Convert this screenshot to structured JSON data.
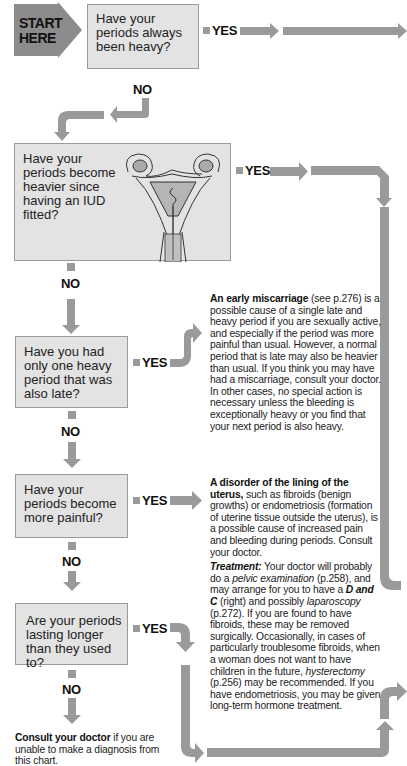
{
  "start": {
    "line1": "START",
    "line2": "HERE"
  },
  "questions": [
    {
      "id": "q1",
      "text": "Have your periods always been heavy?",
      "yes": "YES",
      "no": "NO"
    },
    {
      "id": "q2",
      "text": "Have your periods become heavier since having an IUD fitted?",
      "yes": "YES",
      "no": "NO"
    },
    {
      "id": "q3",
      "text": "Have you had only one heavy period that was also late?",
      "yes": "YES",
      "no": "NO"
    },
    {
      "id": "q4",
      "text": "Have your periods become more painful?",
      "yes": "YES",
      "no": "NO"
    },
    {
      "id": "q5",
      "text": "Are your periods lasting longer than they used to?",
      "yes": "YES",
      "no": "NO"
    }
  ],
  "q2_illustration": "uterus-with-iud-illustration",
  "info_miscarriage": {
    "title": "An early miscarriage",
    "ref": " (see p.276)",
    "body": " is a possible cause of a single late and heavy period if you are sexually active, and especially if the period was more painful than usual. However, a normal period that is late may also be heavier than usual. If you think you may have had a miscarriage, consult your doctor. In other cases, no special action is necessary unless the bleeding is exceptionally heavy or you find that your next period is also heavy."
  },
  "info_disorder": {
    "title": "A disorder of the lining of the uterus,",
    "body": " such as fibroids (benign growths) or endometriosis (formation of uterine tissue outside the uterus), is a possible cause of increased pain and bleeding during periods. Consult your doctor.",
    "treatment_label": "Treatment:",
    "t1": " Your doctor will probably do a ",
    "t_pelvic": "pelvic examination",
    "t2": " (p.258), and may arrange for you to have a ",
    "t_dandc": "D and C",
    "t3": " (right) and possibly ",
    "t_lap": "laparoscopy",
    "t4": " (p.272). If you are found to have fibroids, these may be removed surgically. Occasionally, in cases of particularly troublesome fibroids, when a woman does not want to have children in the future, ",
    "t_hyst": "hysterectomy",
    "t5": " (p.256) may be recommended. If you have endometriosis, you may be given long-term hormone treatment."
  },
  "conclusion": {
    "bold": "Consult your doctor",
    "rest": " if you are unable to make a diagnosis from this chart."
  },
  "colors": {
    "box_fill": "#e3e3e3",
    "box_border": "#9a9a9a",
    "arrow": "#9a9a9a",
    "start_fill": "#8c8c8c"
  }
}
